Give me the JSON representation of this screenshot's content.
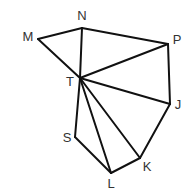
{
  "diagram": {
    "type": "geometric-figure",
    "stroke_color": "#111111",
    "label_color": "#333333",
    "vertices": [
      {
        "id": "M",
        "x": 38,
        "y": 39,
        "label": "M",
        "label_x": 28,
        "label_y": 38
      },
      {
        "id": "N",
        "x": 82,
        "y": 28,
        "label": "N",
        "label_x": 82,
        "label_y": 17
      },
      {
        "id": "P",
        "x": 168,
        "y": 44,
        "label": "P",
        "label_x": 177,
        "label_y": 41
      },
      {
        "id": "T",
        "x": 80,
        "y": 78,
        "label": "T",
        "label_x": 70,
        "label_y": 83
      },
      {
        "id": "J",
        "x": 170,
        "y": 104,
        "label": "J",
        "label_x": 178,
        "label_y": 106
      },
      {
        "id": "S",
        "x": 75,
        "y": 137,
        "label": "S",
        "label_x": 67,
        "label_y": 139
      },
      {
        "id": "L",
        "x": 111,
        "y": 173,
        "label": "L",
        "label_x": 111,
        "label_y": 185
      },
      {
        "id": "K",
        "x": 140,
        "y": 158,
        "label": "K",
        "label_x": 147,
        "label_y": 168
      }
    ],
    "edges": [
      [
        "M",
        "N"
      ],
      [
        "N",
        "P"
      ],
      [
        "M",
        "T"
      ],
      [
        "N",
        "T"
      ],
      [
        "P",
        "T"
      ],
      [
        "P",
        "J"
      ],
      [
        "T",
        "J"
      ],
      [
        "T",
        "K"
      ],
      [
        "T",
        "L"
      ],
      [
        "T",
        "S"
      ],
      [
        "S",
        "L"
      ],
      [
        "L",
        "K"
      ],
      [
        "K",
        "J"
      ]
    ]
  }
}
